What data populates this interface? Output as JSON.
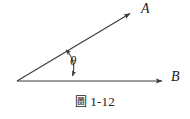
{
  "figure": {
    "caption_word": "圖",
    "caption_number": "1-12",
    "caption_full": "圖 1-12"
  },
  "diagram": {
    "type": "angle-between-two-vectors",
    "vertex": {
      "x": 17,
      "y": 81
    },
    "rays": [
      {
        "name": "ray-a",
        "label": "A",
        "from": {
          "x": 17,
          "y": 81
        },
        "to": {
          "x": 134,
          "y": 11
        },
        "arrowhead": "end"
      },
      {
        "name": "ray-b",
        "label": "B",
        "from": {
          "x": 17,
          "y": 81
        },
        "to": {
          "x": 167,
          "y": 81
        },
        "arrowhead": "end"
      }
    ],
    "angle": {
      "symbol": "θ",
      "marker": "double-headed-curved-arrow",
      "from_point": {
        "x": 64,
        "y": 48
      },
      "to_point": {
        "x": 72,
        "y": 79
      }
    },
    "colors": {
      "background": "#ffffff",
      "stroke": "#3a3a3a",
      "text": "#1c1c1c"
    }
  }
}
